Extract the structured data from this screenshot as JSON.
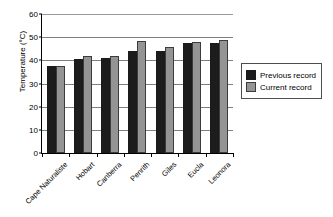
{
  "chart_data": {
    "type": "bar",
    "title": "",
    "xlabel": "",
    "ylabel": "Temperature (°C)",
    "ylim": [
      0,
      60
    ],
    "ytick_step": 10,
    "yticks": [
      60,
      50,
      40,
      30,
      20,
      10,
      0
    ],
    "ytick_labels": [
      "60",
      "50",
      "40",
      "30",
      "20",
      "10",
      "0"
    ],
    "grid": "horizontal",
    "legend_position": "right",
    "categories": [
      "Cape Naturaliste",
      "Hobart",
      "Canberra",
      "Penrith",
      "Giles",
      "Eucla",
      "Leonora"
    ],
    "series": [
      {
        "name": "Previous record",
        "color": "#1c1c1c",
        "values": [
          37.4,
          40.6,
          41.2,
          44.0,
          44.2,
          47.6,
          47.6
        ]
      },
      {
        "name": "Current record",
        "color": "#949494",
        "values": [
          37.6,
          41.7,
          41.8,
          48.4,
          45.7,
          48.0,
          48.9
        ]
      }
    ]
  },
  "legend": {
    "items": [
      {
        "label": "Previous record"
      },
      {
        "label": "Current record"
      }
    ]
  },
  "colors": {
    "previous_record": "#1c1c1c",
    "current_record": "#949494",
    "gridline": "#808080",
    "axis": "#000000",
    "background": "#ffffff"
  }
}
